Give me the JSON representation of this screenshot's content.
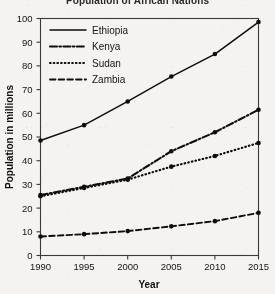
{
  "chart_data": {
    "type": "line",
    "title": "Population of African Nations",
    "xlabel": "Year",
    "ylabel": "Population in millions",
    "x": [
      1990,
      1995,
      2000,
      2005,
      2010,
      2015
    ],
    "xtick_labels": [
      "1990",
      "1995",
      "2000",
      "2005",
      "2010",
      "2015"
    ],
    "ytick_labels": [
      "0",
      "10",
      "20",
      "30",
      "40",
      "50",
      "60",
      "70",
      "80",
      "90",
      "100"
    ],
    "ytick_values": [
      0,
      10,
      20,
      30,
      40,
      50,
      60,
      70,
      80,
      90,
      100
    ],
    "xlim": [
      1990,
      2015
    ],
    "ylim": [
      0,
      100
    ],
    "grid": false,
    "legend_position": "upper-left-inside",
    "series": [
      {
        "name": "Ethiopia",
        "values": [
          48.5,
          55.0,
          65.0,
          75.5,
          85.0,
          98.5
        ],
        "line_style": "solid",
        "color": "#0d0d0d",
        "dasharray": "",
        "width": 1.5
      },
      {
        "name": "Kenya",
        "values": [
          25.5,
          29.0,
          32.5,
          44.0,
          52.0,
          61.5
        ],
        "line_style": "dash-dot",
        "color": "#0d0d0d",
        "dasharray": "7,2.4,1.6,2.4",
        "width": 2.1
      },
      {
        "name": "Sudan",
        "values": [
          25.0,
          28.5,
          32.0,
          37.5,
          42.0,
          47.5
        ],
        "line_style": "dotted",
        "color": "#0d0d0d",
        "dasharray": "0.6,3.1",
        "width": 2.2
      },
      {
        "name": "Zambia",
        "values": [
          8.0,
          9.0,
          10.3,
          12.3,
          14.5,
          18.0
        ],
        "line_style": "dashed",
        "color": "#0d0d0d",
        "dasharray": "5.5,3.2",
        "width": 1.9
      }
    ]
  }
}
